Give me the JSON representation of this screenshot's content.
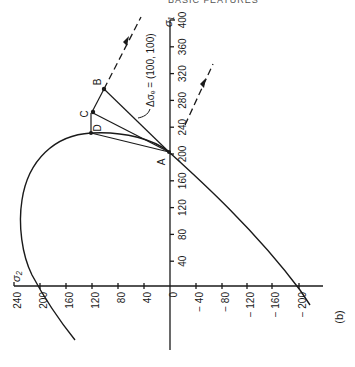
{
  "header": {
    "text": "BASIC FEATURES"
  },
  "figure_label": "(b)",
  "axes": {
    "sigma1": {
      "label": "σ₁",
      "ticks": [
        "40",
        "80",
        "120",
        "160",
        "200",
        "240",
        "280",
        "320",
        "360",
        "400"
      ]
    },
    "sigma2": {
      "label": "σ₂",
      "ticks_positive": [
        "40",
        "80",
        "120",
        "160",
        "200",
        "240"
      ],
      "ticks_negative": [
        "0",
        "− 40",
        "− 80",
        "− 120",
        "− 160",
        "− 200"
      ]
    }
  },
  "points": {
    "A": "A",
    "B": "B",
    "C": "C",
    "D": "D"
  },
  "annotation": {
    "text": "Δσₑ = (100, 100)"
  },
  "colors": {
    "ink": "#1a1a1a",
    "background": "#ffffff"
  }
}
